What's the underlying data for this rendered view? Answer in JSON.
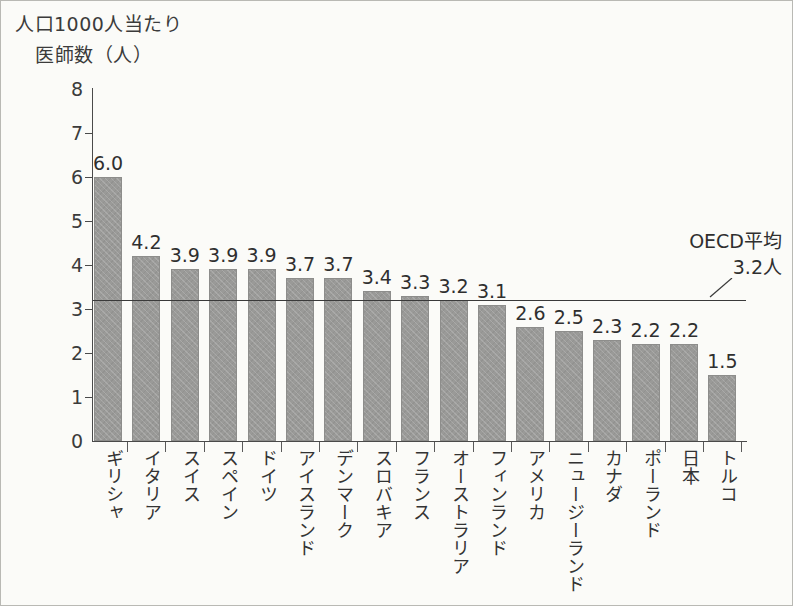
{
  "figure": {
    "background": "#fbfbf8",
    "bar_color": "#9a9a98",
    "axis_color": "#4a4a4a"
  },
  "axis_titles": {
    "y_line1": "人口1000人当たり",
    "y_line2": "医師数（人）"
  },
  "annotation": {
    "label": "OECD平均",
    "value_text": "3.2人",
    "value": 3.2
  },
  "chart_data": {
    "type": "bar",
    "xlabel": "",
    "ylabel": "人口1000人当たり医師数（人）",
    "ylim": [
      0,
      8
    ],
    "yticks": [
      0,
      1,
      2,
      3,
      4,
      5,
      6,
      7,
      8
    ],
    "ytick_labels": [
      "0",
      "1",
      "2",
      "3",
      "4",
      "5",
      "6",
      "7",
      "8"
    ],
    "grid": false,
    "legend": false,
    "categories": [
      "ギリシャ",
      "イタリア",
      "スイス",
      "スペイン",
      "ドイツ",
      "アイスランド",
      "デンマーク",
      "スロバキア",
      "フランス",
      "オーストラリア",
      "フィンランド",
      "アメリカ",
      "ニュージーランド",
      "カナダ",
      "ポーランド",
      "日本",
      "トルコ"
    ],
    "values": [
      6.0,
      4.2,
      3.9,
      3.9,
      3.9,
      3.7,
      3.7,
      3.4,
      3.3,
      3.2,
      3.1,
      2.6,
      2.5,
      2.3,
      2.2,
      2.2,
      1.5
    ],
    "value_labels": [
      "6.0",
      "4.2",
      "3.9",
      "3.9",
      "3.9",
      "3.7",
      "3.7",
      "3.4",
      "3.3",
      "3.2",
      "3.1",
      "2.6",
      "2.5",
      "2.3",
      "2.2",
      "2.2",
      "1.5"
    ],
    "reference_line": {
      "label": "OECD平均",
      "value": 3.2,
      "value_text": "3.2人"
    }
  }
}
